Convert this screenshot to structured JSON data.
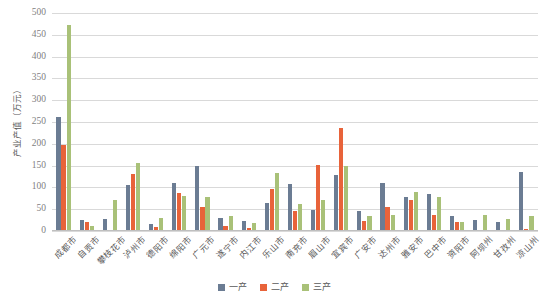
{
  "chart_data": {
    "type": "bar",
    "title": "",
    "xlabel": "",
    "ylabel": "产业产值（万元）",
    "ylim": [
      0,
      500
    ],
    "yticks": [
      500,
      450,
      400,
      350,
      300,
      250,
      200,
      150,
      100,
      50,
      0
    ],
    "grid": true,
    "legend_position": "bottom",
    "categories": [
      "成都市",
      "自贡市",
      "攀枝花市",
      "泸州市",
      "德阳市",
      "绵阳市",
      "广元市",
      "遂宁市",
      "内江市",
      "乐山市",
      "南充市",
      "眉山市",
      "宜宾市",
      "广安市",
      "达州市",
      "雅安市",
      "巴中市",
      "资阳市",
      "阿坝州",
      "甘孜州",
      "凉山州"
    ],
    "series": [
      {
        "name": "一产",
        "color": "#6b7c93",
        "values": [
          261,
          25,
          27,
          106,
          17,
          109,
          148,
          29,
          23,
          64,
          107,
          48,
          128,
          47,
          109,
          78,
          86,
          34,
          25,
          20,
          136
        ]
      },
      {
        "name": "二产",
        "color": "#e8633a",
        "values": [
          198,
          21,
          2,
          131,
          9,
          87,
          54,
          11,
          8,
          96,
          45,
          152,
          237,
          24,
          54,
          70,
          37,
          21,
          2,
          2,
          5
        ]
      },
      {
        "name": "三产",
        "color": "#a9c178",
        "values": [
          472,
          11,
          71,
          157,
          30,
          80,
          77,
          35,
          18,
          134,
          63,
          71,
          148,
          35,
          37,
          90,
          77,
          20,
          36,
          27,
          34
        ]
      }
    ]
  },
  "legend": {
    "items": [
      {
        "label": "一产",
        "swatch": "series-0-swatch"
      },
      {
        "label": "二产",
        "swatch": "series-1-swatch"
      },
      {
        "label": "三产",
        "swatch": "series-2-swatch"
      }
    ]
  }
}
